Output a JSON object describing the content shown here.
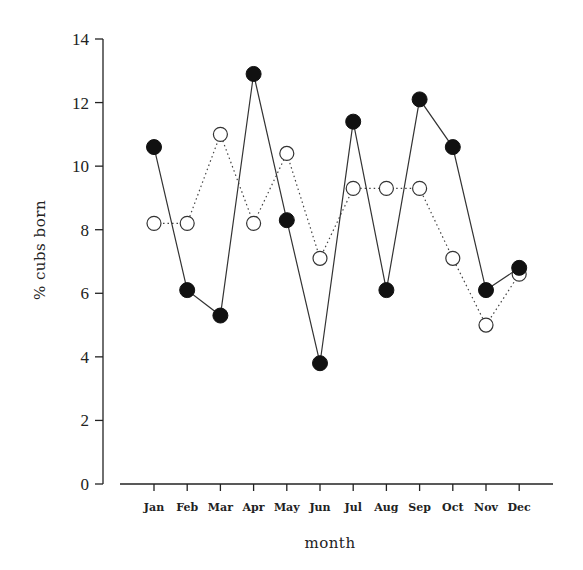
{
  "chart_data": {
    "type": "line",
    "title": "",
    "xlabel": "month",
    "ylabel": "% cubs born",
    "ylim": [
      0,
      14
    ],
    "yticks": [
      0,
      2,
      4,
      6,
      8,
      10,
      12,
      14
    ],
    "grid": false,
    "legend": null,
    "categories": [
      "Jan",
      "Feb",
      "Mar",
      "Apr",
      "May",
      "Jun",
      "Jul",
      "Aug",
      "Sep",
      "Oct",
      "Nov",
      "Dec"
    ],
    "series": [
      {
        "name": "filled circles (solid line)",
        "marker": "filled-circle",
        "line": "solid",
        "values": [
          10.6,
          6.1,
          5.3,
          12.9,
          8.3,
          3.8,
          11.4,
          6.1,
          12.1,
          10.6,
          6.1,
          6.8
        ]
      },
      {
        "name": "open circles (dotted line)",
        "marker": "open-circle",
        "line": "dotted",
        "values": [
          8.2,
          8.2,
          11.0,
          8.2,
          10.4,
          7.1,
          9.3,
          9.3,
          9.3,
          7.1,
          5.0,
          6.6
        ]
      }
    ]
  }
}
